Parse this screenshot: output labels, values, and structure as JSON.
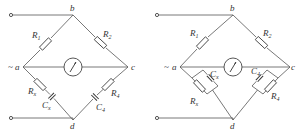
{
  "figure": {
    "type": "bridge-circuit-diagrams",
    "count": 2
  },
  "left_bridge": {
    "nodes": {
      "a": "a",
      "b": "b",
      "c": "c",
      "d": "d"
    },
    "source_symbol": "~",
    "components": {
      "r1": {
        "letter": "R",
        "sub": "1"
      },
      "r2": {
        "letter": "R",
        "sub": "2"
      },
      "rx": {
        "letter": "R",
        "sub": "x"
      },
      "cx": {
        "letter": "C",
        "sub": "x"
      },
      "r4": {
        "letter": "R",
        "sub": "4"
      },
      "c4": {
        "letter": "C",
        "sub": "4"
      }
    },
    "arm_ad": "series Rx-Cx",
    "arm_cd": "series R4-C4"
  },
  "right_bridge": {
    "nodes": {
      "a": "a",
      "b": "b",
      "c": "c",
      "d": "d"
    },
    "source_symbol": "~",
    "components": {
      "r1": {
        "letter": "R",
        "sub": "1"
      },
      "r2": {
        "letter": "R",
        "sub": "2"
      },
      "cx": {
        "letter": "C",
        "sub": "x"
      },
      "rx": {
        "letter": "R",
        "sub": "x"
      },
      "c4": {
        "letter": "C",
        "sub": "4"
      },
      "r4": {
        "letter": "R",
        "sub": "4"
      }
    },
    "arm_ad": "parallel Rx||Cx",
    "arm_cd": "parallel R4||C4"
  }
}
